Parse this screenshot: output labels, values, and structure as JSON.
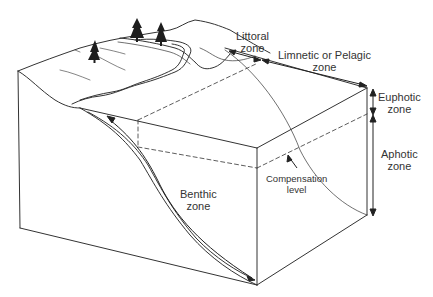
{
  "diagram": {
    "type": "lake-zonation-block-diagram",
    "colors": {
      "line": "#333333",
      "background": "#ffffff",
      "tree": "#222222"
    },
    "labels": {
      "littoral": [
        "Littoral",
        "zone"
      ],
      "limnetic": [
        "Limnetic or Pelagic",
        "zone"
      ],
      "euphotic": [
        "Euphotic",
        "zone"
      ],
      "aphotic": [
        "Aphotic",
        "zone"
      ],
      "compensation": [
        "Compensation",
        "level"
      ],
      "benthic": [
        "Benthic",
        "zone"
      ]
    },
    "icons": {
      "trees": [
        "pine-tree-icon",
        "pine-tree-icon",
        "pine-tree-icon"
      ]
    }
  }
}
